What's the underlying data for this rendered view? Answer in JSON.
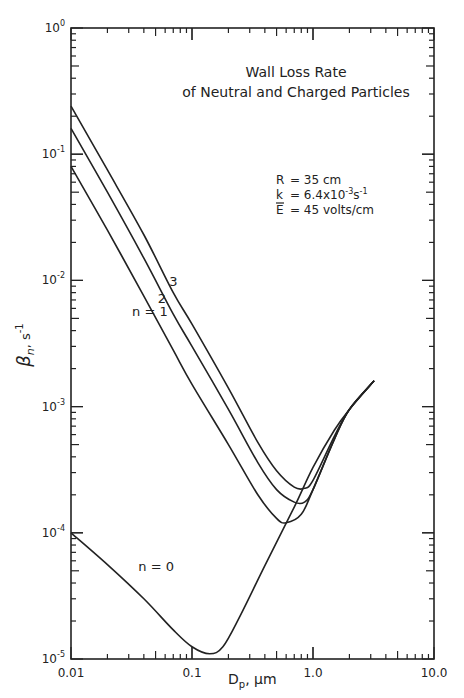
{
  "chart_data": {
    "type": "line",
    "title": "Wall Loss Rate",
    "subtitle": "of Neutral and Charged Particles",
    "xlabel": "Dp, µm",
    "xlabel_main": "D",
    "xlabel_sub": "p",
    "xlabel_unit": ", µm",
    "ylabel": "βn, s⁻¹",
    "xscale": "log",
    "yscale": "log",
    "xlim": [
      0.01,
      10.0
    ],
    "ylim": [
      1e-05,
      1
    ],
    "x_tick_labels": [
      "0.01",
      "0.1",
      "1.0",
      "10.0"
    ],
    "y_tick_labels": [
      {
        "base": "10",
        "exp": "0"
      },
      {
        "base": "10",
        "exp": "-1"
      },
      {
        "base": "10",
        "exp": "-2"
      },
      {
        "base": "10",
        "exp": "-3"
      },
      {
        "base": "10",
        "exp": "-4"
      },
      {
        "base": "10",
        "exp": "-5"
      }
    ],
    "grid": false,
    "annotations": {
      "params": [
        {
          "sym": "R",
          "val": "= 35 cm"
        },
        {
          "sym": "k",
          "val": "= 6.4x10",
          "exp": "-3",
          "unit": "s",
          "unit_exp": "-1"
        },
        {
          "sym": "E",
          "val": "= 45 volts/cm",
          "overline": true
        }
      ]
    },
    "series": [
      {
        "name": "n=0",
        "label": "n = 0",
        "x": [
          0.01,
          0.02,
          0.04,
          0.07,
          0.1,
          0.14,
          0.18,
          0.25,
          0.4,
          0.7,
          1.0,
          1.5,
          2.0,
          3.2
        ],
        "y": [
          0.0001,
          5.6e-05,
          3e-05,
          1.7e-05,
          1.25e-05,
          1.1e-05,
          1.25e-05,
          2.2e-05,
          5.5e-05,
          0.00016,
          0.00033,
          0.00065,
          0.00095,
          0.0016
        ]
      },
      {
        "name": "n=1",
        "label": "n = 1",
        "x": [
          0.01,
          0.02,
          0.04,
          0.07,
          0.1,
          0.2,
          0.35,
          0.5,
          0.6,
          0.8,
          1.0,
          1.5,
          2.0,
          3.2
        ],
        "y": [
          0.08,
          0.025,
          0.0075,
          0.0028,
          0.0015,
          0.0005,
          0.0002,
          0.00013,
          0.00012,
          0.00014,
          0.00022,
          0.00055,
          0.00095,
          0.0016
        ]
      },
      {
        "name": "n=2",
        "label": "2",
        "x": [
          0.01,
          0.02,
          0.04,
          0.07,
          0.1,
          0.2,
          0.35,
          0.5,
          0.7,
          0.85,
          1.0,
          1.5,
          2.0,
          3.2
        ],
        "y": [
          0.16,
          0.05,
          0.015,
          0.0054,
          0.003,
          0.00095,
          0.00036,
          0.00022,
          0.000175,
          0.000175,
          0.00022,
          0.00055,
          0.00095,
          0.0016
        ]
      },
      {
        "name": "n=3",
        "label": "3",
        "x": [
          0.01,
          0.02,
          0.04,
          0.07,
          0.1,
          0.2,
          0.35,
          0.5,
          0.7,
          0.85,
          1.0,
          1.5,
          2.0,
          3.2
        ],
        "y": [
          0.24,
          0.075,
          0.023,
          0.008,
          0.0045,
          0.0014,
          0.00052,
          0.00031,
          0.00023,
          0.000225,
          0.00026,
          0.00058,
          0.00095,
          0.0016
        ]
      }
    ],
    "series_label_positions": [
      {
        "name": "n=0",
        "x": 0.036,
        "y": 5e-05
      },
      {
        "name": "n=1",
        "x": 0.032,
        "y": 0.0052
      },
      {
        "name": "n=2",
        "x": 0.052,
        "y": 0.0066
      },
      {
        "name": "n=3",
        "x": 0.065,
        "y": 0.009
      }
    ]
  }
}
